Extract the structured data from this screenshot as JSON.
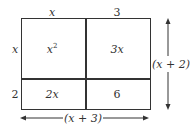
{
  "diagram": {
    "top_labels": {
      "left": "x",
      "right": "3"
    },
    "side_labels": {
      "top": "x",
      "bottom": "2"
    },
    "cells": {
      "top_left": {
        "base": "x",
        "sup": "2"
      },
      "top_right": "3x",
      "bottom_left": "2x",
      "bottom_right": "6"
    },
    "dimensions": {
      "height": "(x + 2)",
      "width": "(x + 3)"
    },
    "colors": {
      "stroke": "#333333",
      "background": "#ffffff"
    }
  }
}
